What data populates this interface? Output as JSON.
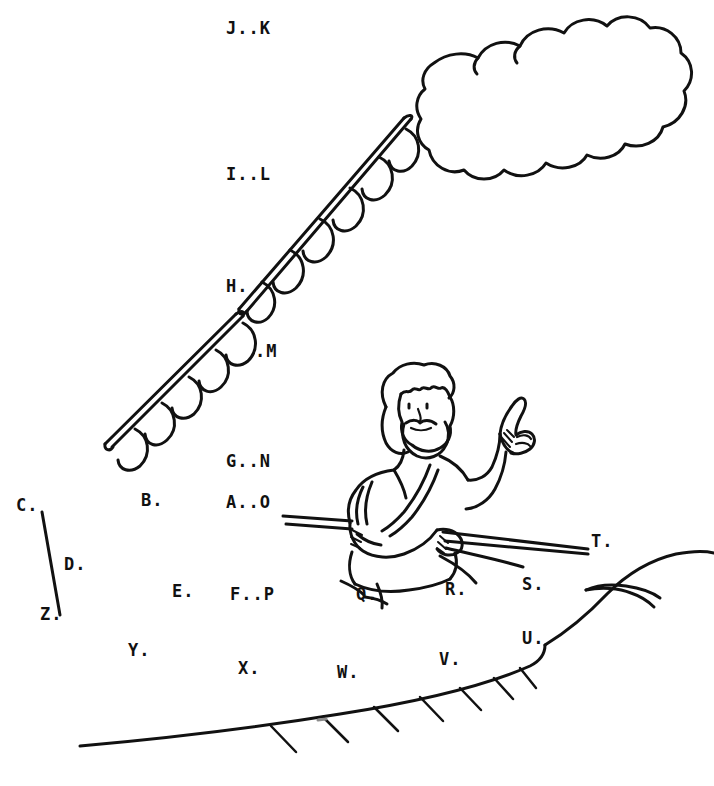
{
  "page": {
    "type": "connect-the-dots-coloring-page",
    "width": 714,
    "height": 786,
    "background_color": "#ffffff",
    "ink_color": "#111111"
  },
  "scene": {
    "description": "Line-art connect-the-dots puzzle: a robed bearded figure with raised index finger holds a long palm branch, a large cloud floats at upper right, a hill slopes across the lower right, and a short line segment joins dots C and Z at the left.",
    "elements": [
      "cloud",
      "palm-branch-upper",
      "palm-branch-lower",
      "robed-figure",
      "staff-branch",
      "hill",
      "ground-line",
      "c-to-z-line"
    ]
  },
  "dots": {
    "count": 26,
    "labels": [
      {
        "id": "A",
        "text": "A",
        "x": 228,
        "y": 502,
        "trailing_dots": 2
      },
      {
        "id": "B",
        "text": "B",
        "x": 143,
        "y": 500,
        "trailing_dots": 1
      },
      {
        "id": "C",
        "text": "C",
        "x": 18,
        "y": 505,
        "trailing_dots": 1
      },
      {
        "id": "D",
        "text": "D",
        "x": 66,
        "y": 564,
        "trailing_dots": 1
      },
      {
        "id": "E",
        "text": "E",
        "x": 174,
        "y": 591,
        "trailing_dots": 1
      },
      {
        "id": "F",
        "text": "F",
        "x": 232,
        "y": 594,
        "trailing_dots": 1
      },
      {
        "id": "G",
        "text": "G",
        "x": 228,
        "y": 461,
        "trailing_dots": 2
      },
      {
        "id": "H",
        "text": "H",
        "x": 229,
        "y": 286,
        "trailing_dots": 1
      },
      {
        "id": "I",
        "text": "I",
        "x": 228,
        "y": 174,
        "trailing_dots": 2
      },
      {
        "id": "J",
        "text": "J",
        "x": 229,
        "y": 28,
        "trailing_dots": 2
      },
      {
        "id": "K",
        "text": "K",
        "x": 265,
        "y": 28,
        "leading_dot": true
      },
      {
        "id": "L",
        "text": "L",
        "x": 265,
        "y": 174,
        "leading_dot": true
      },
      {
        "id": "M",
        "text": "M",
        "x": 264,
        "y": 351,
        "leading_dot": true
      },
      {
        "id": "N",
        "text": "N",
        "x": 265,
        "y": 461,
        "leading_dot": true
      },
      {
        "id": "O",
        "text": "O",
        "x": 265,
        "y": 502,
        "leading_dot": true
      },
      {
        "id": "P",
        "text": "P",
        "x": 268,
        "y": 594,
        "leading_dot": true
      },
      {
        "id": "Q",
        "text": "Q",
        "x": 358,
        "y": 594,
        "trailing_dots": 1
      },
      {
        "id": "R",
        "text": "R",
        "x": 447,
        "y": 589,
        "trailing_dots": 1
      },
      {
        "id": "S",
        "text": "S",
        "x": 524,
        "y": 584,
        "trailing_dots": 1
      },
      {
        "id": "T",
        "text": "T",
        "x": 593,
        "y": 541,
        "trailing_dots": 1
      },
      {
        "id": "U",
        "text": "U",
        "x": 524,
        "y": 638,
        "trailing_dots": 1
      },
      {
        "id": "V",
        "text": "V",
        "x": 441,
        "y": 659,
        "trailing_dots": 1
      },
      {
        "id": "W",
        "text": "W",
        "x": 339,
        "y": 672,
        "trailing_dots": 1
      },
      {
        "id": "X",
        "text": "X",
        "x": 240,
        "y": 668,
        "trailing_dots": 1
      },
      {
        "id": "Y",
        "text": "Y",
        "x": 130,
        "y": 650,
        "trailing_dots": 1
      },
      {
        "id": "Z",
        "text": "Z",
        "x": 42,
        "y": 614,
        "trailing_dots": 1
      }
    ],
    "groups": [
      {
        "text": "J..K",
        "x": 226,
        "y": 20
      },
      {
        "text": "I..L",
        "x": 226,
        "y": 166
      },
      {
        "text": "H.",
        "x": 226,
        "y": 278
      },
      {
        "text": ".M",
        "x": 255,
        "y": 343
      },
      {
        "text": "G..N",
        "x": 226,
        "y": 453
      },
      {
        "text": "B.",
        "x": 141,
        "y": 492
      },
      {
        "text": "A..O",
        "x": 226,
        "y": 494
      },
      {
        "text": "C.",
        "x": 16,
        "y": 497
      },
      {
        "text": "D.",
        "x": 64,
        "y": 556
      },
      {
        "text": "E.",
        "x": 172,
        "y": 583
      },
      {
        "text": "F..P",
        "x": 230,
        "y": 586
      },
      {
        "text": "Q.",
        "x": 356,
        "y": 586
      },
      {
        "text": "R.",
        "x": 445,
        "y": 581
      },
      {
        "text": "S.",
        "x": 522,
        "y": 576
      },
      {
        "text": "T.",
        "x": 591,
        "y": 533
      },
      {
        "text": "U.",
        "x": 522,
        "y": 630
      },
      {
        "text": "V.",
        "x": 439,
        "y": 651
      },
      {
        "text": "W.",
        "x": 337,
        "y": 664
      },
      {
        "text": "X.",
        "x": 238,
        "y": 660
      },
      {
        "text": "Y.",
        "x": 128,
        "y": 642
      },
      {
        "text": "Z.",
        "x": 40,
        "y": 606
      }
    ]
  }
}
